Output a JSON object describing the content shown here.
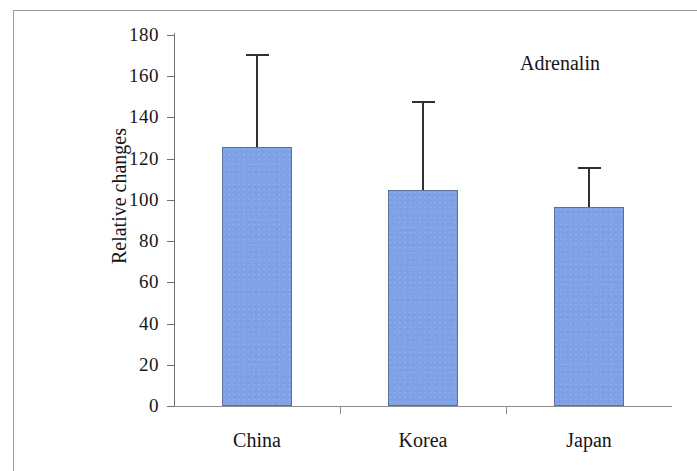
{
  "chart_data": {
    "type": "bar",
    "title": "",
    "annotation": "Adrenalin",
    "xlabel": "",
    "ylabel": "Relative changes",
    "categories": [
      "China",
      "Korea",
      "Japan"
    ],
    "values": [
      125.5,
      105,
      96.5
    ],
    "error_high": [
      171,
      148,
      116
    ],
    "series": [
      {
        "name": "Adrenalin",
        "values": [
          125.5,
          105,
          96.5
        ],
        "error_high": [
          171,
          148,
          116
        ]
      }
    ],
    "ylim": [
      0,
      180
    ],
    "ytick_labels": [
      "180",
      "160",
      "140",
      "120",
      "100",
      "80",
      "60",
      "40",
      "20",
      "0"
    ],
    "ytick_values": [
      180,
      160,
      140,
      120,
      100,
      80,
      60,
      40,
      20,
      0
    ],
    "grid": false,
    "legend": false,
    "bar_color": "#7fa2e6",
    "bar_border_color": "#5a6f9c",
    "error_bar_color": "#303030",
    "axis_color": "#6f6f6f",
    "frame_color": "#9a9a9a",
    "text_color": "#151515"
  }
}
